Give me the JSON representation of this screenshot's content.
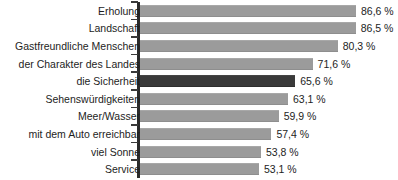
{
  "chart_data": {
    "type": "bar",
    "orientation": "horizontal",
    "title": "",
    "subtitle": "",
    "xlabel": "",
    "ylabel": "",
    "xlim": [
      0,
      100
    ],
    "grid": false,
    "legend": null,
    "value_suffix": " %",
    "decimal_separator": ",",
    "categories": [
      "Erholung",
      "Landschaft",
      "Gastfreundliche Menschen",
      "der Charakter des Landes",
      "die Sicherheit",
      "Sehenswürdigkeiten",
      "Meer/Wasser",
      "mit dem Auto erreichbar",
      "viel Sonne",
      "Service"
    ],
    "values": [
      86.6,
      86.5,
      80.3,
      71.6,
      65.6,
      63.1,
      59.9,
      57.4,
      53.8,
      53.1
    ],
    "value_labels": [
      "86,6 %",
      "86,5 %",
      "80,3 %",
      "71,6 %",
      "65,6 %",
      "63,1 %",
      "59,9 %",
      "57,4 %",
      "53,8 %",
      "53,1 %"
    ],
    "highlight_index": 4,
    "colors": {
      "bar": "#9b9b9b",
      "bar_highlight": "#3a3a3a",
      "axis": "#2b2b2b",
      "text": "#1d1d1d",
      "background": "#ffffff"
    }
  }
}
